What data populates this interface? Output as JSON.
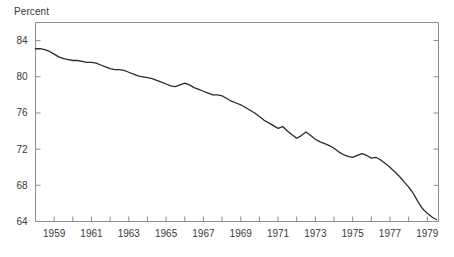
{
  "chart_data": {
    "type": "line",
    "title": "",
    "ylabel": "Percent",
    "xlabel": "",
    "ylim": [
      64,
      86
    ],
    "xlim": [
      1958.0,
      1979.6
    ],
    "yticks": [
      64,
      68,
      72,
      76,
      80,
      84
    ],
    "ytick_labels": [
      "64",
      "68",
      "72",
      "76",
      "80",
      "84"
    ],
    "xticks": [
      1959,
      1960,
      1961,
      1962,
      1963,
      1964,
      1965,
      1966,
      1967,
      1968,
      1969,
      1970,
      1971,
      1972,
      1973,
      1974,
      1975,
      1976,
      1977,
      1978,
      1979
    ],
    "xtick_labels": [
      "1959",
      "",
      "1961",
      "",
      "1963",
      "",
      "1965",
      "",
      "1967",
      "",
      "1969",
      "",
      "1971",
      "",
      "1973",
      "",
      "1975",
      "",
      "1977",
      "",
      "1979"
    ],
    "grid": false,
    "legend": false,
    "series": [
      {
        "name": "Percent",
        "color": "#2b2b2b",
        "x": [
          1958.0,
          1958.25,
          1958.5,
          1958.75,
          1959.0,
          1959.25,
          1959.5,
          1959.75,
          1960.0,
          1960.25,
          1960.5,
          1960.75,
          1961.0,
          1961.25,
          1961.5,
          1961.75,
          1962.0,
          1962.25,
          1962.5,
          1962.75,
          1963.0,
          1963.25,
          1963.5,
          1963.75,
          1964.0,
          1964.25,
          1964.5,
          1964.75,
          1965.0,
          1965.25,
          1965.5,
          1965.75,
          1966.0,
          1966.25,
          1966.5,
          1966.75,
          1967.0,
          1967.25,
          1967.5,
          1967.75,
          1968.0,
          1968.25,
          1968.5,
          1968.75,
          1969.0,
          1969.25,
          1969.5,
          1969.75,
          1970.0,
          1970.25,
          1970.5,
          1970.75,
          1971.0,
          1971.25,
          1971.5,
          1971.75,
          1972.0,
          1972.25,
          1972.5,
          1972.75,
          1973.0,
          1973.25,
          1973.5,
          1973.75,
          1974.0,
          1974.25,
          1974.5,
          1974.75,
          1975.0,
          1975.25,
          1975.5,
          1975.75,
          1976.0,
          1976.25,
          1976.5,
          1976.75,
          1977.0,
          1977.25,
          1977.5,
          1977.75,
          1978.0,
          1978.25,
          1978.5,
          1978.75,
          1979.0,
          1979.25,
          1979.5
        ],
        "y": [
          83.1,
          83.1,
          83.0,
          82.8,
          82.5,
          82.2,
          82.0,
          81.9,
          81.8,
          81.8,
          81.7,
          81.6,
          81.6,
          81.5,
          81.3,
          81.1,
          80.9,
          80.8,
          80.8,
          80.7,
          80.5,
          80.3,
          80.1,
          80.0,
          79.9,
          79.8,
          79.6,
          79.4,
          79.2,
          79.0,
          78.9,
          79.1,
          79.3,
          79.1,
          78.8,
          78.6,
          78.4,
          78.2,
          78.0,
          78.0,
          77.9,
          77.6,
          77.3,
          77.1,
          76.9,
          76.6,
          76.3,
          76.0,
          75.6,
          75.2,
          74.9,
          74.6,
          74.3,
          74.5,
          74.0,
          73.6,
          73.2,
          73.5,
          73.9,
          73.5,
          73.1,
          72.8,
          72.6,
          72.4,
          72.1,
          71.7,
          71.4,
          71.2,
          71.1,
          71.3,
          71.5,
          71.3,
          71.0,
          71.1,
          70.8,
          70.4,
          70.0,
          69.5,
          69.0,
          68.4,
          67.8,
          67.1,
          66.2,
          65.4,
          64.9,
          64.5,
          64.2
        ]
      }
    ]
  },
  "axis": {
    "ylabel_text": "Percent"
  }
}
